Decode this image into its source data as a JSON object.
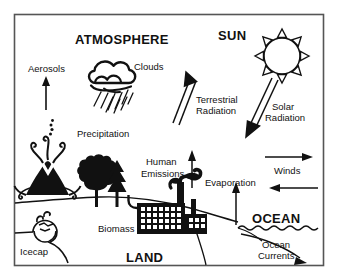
{
  "diagram": {
    "title_headings": [
      {
        "key": "atmosphere",
        "label": "ATMOSPHERE"
      },
      {
        "key": "sun",
        "label": "SUN"
      },
      {
        "key": "ocean",
        "label": "OCEAN"
      },
      {
        "key": "land",
        "label": "LAND"
      }
    ],
    "labels": [
      {
        "key": "aerosols",
        "label": "Aerosols"
      },
      {
        "key": "clouds",
        "label": "Clouds"
      },
      {
        "key": "precipitation",
        "label": "Precipitation"
      },
      {
        "key": "terrestrial_radiation_line1",
        "label": "Terrestrial"
      },
      {
        "key": "terrestrial_radiation_line2",
        "label": "Radiation"
      },
      {
        "key": "solar_radiation_line1",
        "label": "Solar"
      },
      {
        "key": "solar_radiation_line2",
        "label": "Radiation"
      },
      {
        "key": "human_emissions_line1",
        "label": "Human"
      },
      {
        "key": "human_emissions_line2",
        "label": "Emissions"
      },
      {
        "key": "evaporation",
        "label": "Evaporation"
      },
      {
        "key": "winds",
        "label": "Winds"
      },
      {
        "key": "biomass",
        "label": "Biomass"
      },
      {
        "key": "icecap",
        "label": "Icecap"
      },
      {
        "key": "ocean_currents_line1",
        "label": "Ocean"
      },
      {
        "key": "ocean_currents_line2",
        "label": "Currents"
      }
    ],
    "icons": [
      {
        "key": "sun",
        "name": "sun-icon"
      },
      {
        "key": "cloud",
        "name": "cloud-icon"
      },
      {
        "key": "rain",
        "name": "rain-icon"
      },
      {
        "key": "volcano",
        "name": "volcano-icon"
      },
      {
        "key": "trees",
        "name": "trees-icon"
      },
      {
        "key": "factory",
        "name": "factory-icon"
      },
      {
        "key": "icecap",
        "name": "icecap-icon"
      },
      {
        "key": "ocean_waves",
        "name": "ocean-waves-icon"
      }
    ],
    "colors": {
      "ink": "#111111",
      "border": "#555555",
      "background": "#ffffff"
    }
  }
}
